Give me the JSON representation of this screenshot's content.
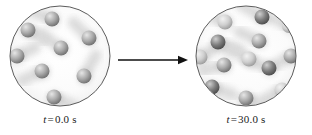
{
  "figure": {
    "kind": "diffusion-mixing-illustration",
    "background_color": "#ffffff",
    "vessel_outline_color": "#4a4a4a",
    "canvas": {
      "width": 312,
      "height": 135
    }
  },
  "arrow": {
    "name": "process-arrow",
    "direction": "right",
    "color": "#111111",
    "x1": 2,
    "y1": 10,
    "x2": 72,
    "y2": 10
  },
  "panels": [
    {
      "id": "left",
      "label": {
        "symbol": "t",
        "equals": "=",
        "value": "0.0 s",
        "full": "t = 0.0 s"
      },
      "vessel": {
        "cx": 56,
        "cy": 52,
        "r": 50
      },
      "particle_count": 8,
      "particles": [
        {
          "cx": 48,
          "cy": 15,
          "r": 7.5,
          "tone": "mid",
          "trail_angle": 200,
          "trail_len": 22
        },
        {
          "cx": 24,
          "cy": 26,
          "r": 7.5,
          "tone": "mid",
          "trail_angle": 30,
          "trail_len": 20
        },
        {
          "cx": 57,
          "cy": 44,
          "r": 7.5,
          "tone": "mid",
          "trail_angle": 215,
          "trail_len": 24
        },
        {
          "cx": 85,
          "cy": 34,
          "r": 7.5,
          "tone": "mid",
          "trail_angle": 225,
          "trail_len": 22
        },
        {
          "cx": 13,
          "cy": 52,
          "r": 7.5,
          "tone": "mid",
          "trail_angle": 335,
          "trail_len": 20
        },
        {
          "cx": 38,
          "cy": 67,
          "r": 7.5,
          "tone": "mid",
          "trail_angle": 155,
          "trail_len": 22
        },
        {
          "cx": 80,
          "cy": 72,
          "r": 7.5,
          "tone": "mid",
          "trail_angle": 300,
          "trail_len": 24
        },
        {
          "cx": 50,
          "cy": 93,
          "r": 7.5,
          "tone": "mid",
          "trail_angle": 25,
          "trail_len": 22
        }
      ]
    },
    {
      "id": "right",
      "label": {
        "symbol": "t",
        "equals": "=",
        "value": "30.0 s",
        "full": "t = 30.0 s"
      },
      "vessel": {
        "cx": 56,
        "cy": 52,
        "r": 50
      },
      "particle_count": 13,
      "particles": [
        {
          "cx": 35,
          "cy": 18,
          "r": 7.5,
          "tone": "light",
          "trail_angle": 200,
          "trail_len": 22
        },
        {
          "cx": 72,
          "cy": 13,
          "r": 7.5,
          "tone": "dark",
          "trail_angle": 210,
          "trail_len": 24
        },
        {
          "cx": 99,
          "cy": 22,
          "r": 7.0,
          "tone": "light",
          "trail_angle": 205,
          "trail_len": 18
        },
        {
          "cx": 28,
          "cy": 38,
          "r": 7.5,
          "tone": "dark",
          "trail_angle": 20,
          "trail_len": 24
        },
        {
          "cx": 69,
          "cy": 37,
          "r": 7.5,
          "tone": "mid",
          "trail_angle": 205,
          "trail_len": 22
        },
        {
          "cx": 10,
          "cy": 53,
          "r": 7.5,
          "tone": "light",
          "trail_angle": 330,
          "trail_len": 18
        },
        {
          "cx": 59,
          "cy": 55,
          "r": 7.5,
          "tone": "light",
          "trail_angle": 205,
          "trail_len": 24
        },
        {
          "cx": 101,
          "cy": 52,
          "r": 7.5,
          "tone": "mid",
          "trail_angle": 150,
          "trail_len": 18
        },
        {
          "cx": 34,
          "cy": 61,
          "r": 7.5,
          "tone": "mid",
          "trail_angle": 165,
          "trail_len": 22
        },
        {
          "cx": 79,
          "cy": 64,
          "r": 7.5,
          "tone": "dark",
          "trail_angle": 200,
          "trail_len": 24
        },
        {
          "cx": 22,
          "cy": 83,
          "r": 7.5,
          "tone": "dark",
          "trail_angle": 20,
          "trail_len": 22
        },
        {
          "cx": 92,
          "cy": 86,
          "r": 7.5,
          "tone": "light",
          "trail_angle": 150,
          "trail_len": 20
        },
        {
          "cx": 56,
          "cy": 94,
          "r": 7.5,
          "tone": "mid",
          "trail_angle": 25,
          "trail_len": 22
        }
      ]
    }
  ],
  "particle_tones": {
    "light": {
      "highlight": "#f2f2f2",
      "mid": "#cfcfcf",
      "shadow": "#9a9a9a"
    },
    "mid": {
      "highlight": "#e6e6e6",
      "mid": "#a9a9a9",
      "shadow": "#6e6e6e"
    },
    "dark": {
      "highlight": "#cfcfcf",
      "mid": "#7d7d7d",
      "shadow": "#4a4a4a"
    }
  },
  "trail_color": "#d9d9d9"
}
